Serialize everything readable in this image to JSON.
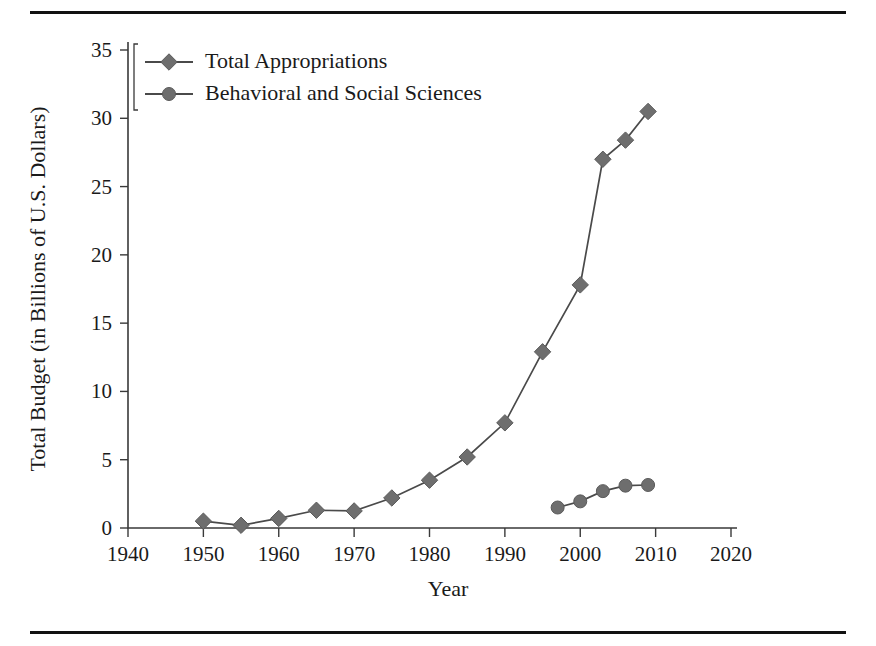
{
  "figure": {
    "top_rule": "horizontal-rule",
    "bottom_rule": "horizontal-rule"
  },
  "chart_data": {
    "type": "line",
    "title": "",
    "xlabel": "Year",
    "ylabel": "Total Budget (in Billions of U.S. Dollars)",
    "xlim": [
      1940,
      2020
    ],
    "ylim": [
      0,
      35
    ],
    "xticks": [
      1940,
      1950,
      1960,
      1970,
      1980,
      1990,
      2000,
      2010,
      2020
    ],
    "xtick_labels": [
      "1940",
      "1950",
      "1960",
      "1970",
      "1980",
      "1990",
      "2000",
      "2010",
      "2020"
    ],
    "yticks": [
      0,
      5,
      10,
      15,
      20,
      25,
      30,
      35
    ],
    "ytick_labels": [
      "0",
      "5",
      "10",
      "15",
      "20",
      "25",
      "30",
      "35"
    ],
    "grid": false,
    "legend_position": "upper-left",
    "series": [
      {
        "name": "Total Appropriations",
        "marker": "diamond",
        "color": "#6e6e6e",
        "x": [
          1950,
          1955,
          1960,
          1965,
          1970,
          1975,
          1980,
          1985,
          1990,
          1995,
          2000,
          2003,
          2006,
          2009
        ],
        "values": [
          0.5,
          0.2,
          0.7,
          1.3,
          1.25,
          2.2,
          3.5,
          5.2,
          7.7,
          12.9,
          17.8,
          27.0,
          28.4,
          30.5
        ]
      },
      {
        "name": "Behavioral and Social Sciences",
        "marker": "circle",
        "color": "#6e6e6e",
        "x": [
          1997,
          2000,
          2003,
          2006,
          2009
        ],
        "values": [
          1.5,
          1.95,
          2.7,
          3.1,
          3.15
        ]
      }
    ]
  },
  "legend": {
    "items": [
      {
        "label": "Total Appropriations",
        "marker": "diamond"
      },
      {
        "label": "Behavioral and Social Sciences",
        "marker": "circle"
      }
    ]
  }
}
